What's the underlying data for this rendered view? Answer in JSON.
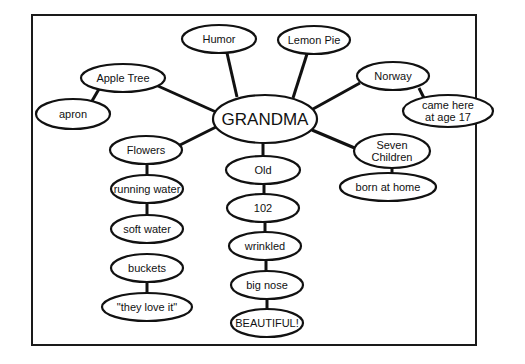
{
  "diagram": {
    "type": "concept-map",
    "center": {
      "id": "grandma",
      "label": "GRANDMA",
      "cx": 265,
      "cy": 119,
      "rx": 52,
      "ry": 24
    },
    "nodes": [
      {
        "id": "humor",
        "label": "Humor",
        "cx": 219,
        "cy": 39,
        "rx": 37,
        "ry": 14
      },
      {
        "id": "lemon-pie",
        "label": "Lemon Pie",
        "cx": 314,
        "cy": 40,
        "rx": 36,
        "ry": 14
      },
      {
        "id": "apple-tree",
        "label": "Apple Tree",
        "cx": 123,
        "cy": 78,
        "rx": 42,
        "ry": 14
      },
      {
        "id": "apron",
        "label": "apron",
        "cx": 73,
        "cy": 114,
        "rx": 37,
        "ry": 15
      },
      {
        "id": "norway",
        "label": "Norway",
        "cx": 393,
        "cy": 76,
        "rx": 36,
        "ry": 14
      },
      {
        "id": "came-here",
        "label_lines": [
          "came here",
          "at age 17"
        ],
        "cx": 448,
        "cy": 111,
        "rx": 45,
        "ry": 16
      },
      {
        "id": "flowers",
        "label": "Flowers",
        "cx": 146,
        "cy": 150,
        "rx": 36,
        "ry": 14
      },
      {
        "id": "seven-children",
        "label_lines": [
          "Seven",
          "Children"
        ],
        "cx": 392,
        "cy": 151,
        "rx": 38,
        "ry": 17
      },
      {
        "id": "born-at-home",
        "label": "born at home",
        "cx": 388,
        "cy": 187,
        "rx": 48,
        "ry": 14
      },
      {
        "id": "old",
        "label": "Old",
        "cx": 263,
        "cy": 170,
        "rx": 37,
        "ry": 14
      },
      {
        "id": "running-water",
        "label": "running water",
        "cx": 147,
        "cy": 189,
        "rx": 36,
        "ry": 14
      },
      {
        "id": "102",
        "label": "102",
        "cx": 263,
        "cy": 208,
        "rx": 36,
        "ry": 14
      },
      {
        "id": "soft-water",
        "label": "soft water",
        "cx": 147,
        "cy": 229,
        "rx": 36,
        "ry": 14
      },
      {
        "id": "wrinkled",
        "label": "wrinkled",
        "cx": 265,
        "cy": 246,
        "rx": 36,
        "ry": 14
      },
      {
        "id": "buckets",
        "label": "buckets",
        "cx": 147,
        "cy": 268,
        "rx": 36,
        "ry": 14
      },
      {
        "id": "big-nose",
        "label": "big nose",
        "cx": 267,
        "cy": 285,
        "rx": 36,
        "ry": 14
      },
      {
        "id": "they-love-it",
        "label": "\"they love it\"",
        "cx": 147,
        "cy": 307,
        "rx": 45,
        "ry": 14
      },
      {
        "id": "beautiful",
        "label": "BEAUTIFUL!",
        "cx": 267,
        "cy": 323,
        "rx": 36,
        "ry": 14
      }
    ],
    "edges": [
      {
        "from": "grandma",
        "to": "humor",
        "x1": 237,
        "y1": 97,
        "x2": 227,
        "y2": 53
      },
      {
        "from": "grandma",
        "to": "lemon-pie",
        "x1": 293,
        "y1": 98,
        "x2": 307,
        "y2": 54
      },
      {
        "from": "grandma",
        "to": "apple-tree",
        "x1": 216,
        "y1": 112,
        "x2": 158,
        "y2": 86
      },
      {
        "from": "apple-tree",
        "to": "apron",
        "x1": 99,
        "y1": 89,
        "x2": 92,
        "y2": 101
      },
      {
        "from": "grandma",
        "to": "norway",
        "x1": 313,
        "y1": 109,
        "x2": 360,
        "y2": 83
      },
      {
        "from": "norway",
        "to": "came-here",
        "x1": 419,
        "y1": 88,
        "x2": 424,
        "y2": 98
      },
      {
        "from": "grandma",
        "to": "flowers",
        "x1": 216,
        "y1": 127,
        "x2": 180,
        "y2": 145
      },
      {
        "from": "grandma",
        "to": "seven-children",
        "x1": 312,
        "y1": 130,
        "x2": 357,
        "y2": 149
      },
      {
        "from": "seven-children",
        "to": "born-at-home",
        "x1": 392,
        "y1": 167,
        "x2": 392,
        "y2": 174
      },
      {
        "from": "grandma",
        "to": "old",
        "x1": 263,
        "y1": 143,
        "x2": 263,
        "y2": 156
      },
      {
        "from": "flowers",
        "to": "running-water",
        "x1": 147,
        "y1": 164,
        "x2": 147,
        "y2": 175
      },
      {
        "from": "old",
        "to": "102",
        "x1": 264,
        "y1": 184,
        "x2": 264,
        "y2": 194
      },
      {
        "from": "running-water",
        "to": "soft-water",
        "x1": 147,
        "y1": 203,
        "x2": 147,
        "y2": 215
      },
      {
        "from": "102",
        "to": "wrinkled",
        "x1": 265,
        "y1": 222,
        "x2": 265,
        "y2": 232
      },
      {
        "from": "buckets",
        "to": "they-love-it",
        "x1": 147,
        "y1": 282,
        "x2": 147,
        "y2": 293
      },
      {
        "from": "wrinkled",
        "to": "big-nose",
        "x1": 266,
        "y1": 260,
        "x2": 266,
        "y2": 271
      },
      {
        "from": "big-nose",
        "to": "beautiful",
        "x1": 267,
        "y1": 299,
        "x2": 267,
        "y2": 309
      }
    ],
    "frame": {
      "x": 32,
      "y": 15,
      "width": 444,
      "height": 330
    }
  }
}
